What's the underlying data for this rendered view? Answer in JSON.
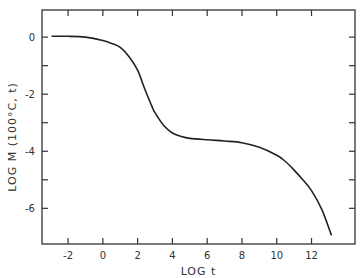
{
  "chart_data": {
    "type": "line",
    "title": "",
    "xlabel": "LOG t",
    "ylabel": "LOG M (100°C, t)",
    "xlim": [
      -3.5,
      14.5
    ],
    "ylim": [
      -7.25,
      0.95
    ],
    "grid": false,
    "legend": "none",
    "x_ticks": [
      -2,
      0,
      2,
      4,
      6,
      8,
      10,
      12
    ],
    "x_tick_labels": [
      "-2",
      "0",
      "2",
      "4",
      "6",
      "8",
      "10",
      "12"
    ],
    "y_ticks": [
      0,
      -1,
      -2,
      -3,
      -4,
      -5,
      -6
    ],
    "y_tick_labels": [
      "0",
      "",
      "-2",
      "",
      "-4",
      "",
      "-6"
    ],
    "series": [
      {
        "name": "LOG M",
        "x": [
          -2.95,
          -2,
          -1,
          0,
          0.5,
          1,
          1.5,
          2,
          2.4,
          2.8,
          3,
          3.5,
          4,
          4.5,
          5,
          6,
          7,
          8,
          9,
          10,
          10.5,
          11,
          11.5,
          12,
          12.6,
          13.15
        ],
        "y": [
          0.03,
          0.03,
          0.0,
          -0.12,
          -0.22,
          -0.36,
          -0.68,
          -1.16,
          -1.8,
          -2.4,
          -2.65,
          -3.1,
          -3.36,
          -3.48,
          -3.55,
          -3.6,
          -3.64,
          -3.7,
          -3.86,
          -4.14,
          -4.36,
          -4.66,
          -5.0,
          -5.38,
          -6.05,
          -6.95
        ]
      }
    ]
  }
}
